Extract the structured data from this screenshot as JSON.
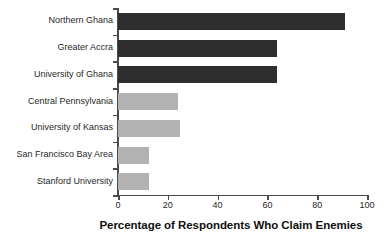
{
  "chart_data": {
    "type": "bar",
    "orientation": "horizontal",
    "title": "",
    "xlabel": "Percentage of Respondents Who Claim Enemies",
    "ylabel": "",
    "xlim": [
      0,
      100
    ],
    "xticks": [
      0,
      20,
      40,
      60,
      80,
      100
    ],
    "xtick_labels": [
      "0",
      "20",
      "40",
      "60",
      "80",
      "100"
    ],
    "grid": false,
    "legend": null,
    "categories": [
      "Northern Ghana",
      "Greater Accra",
      "University of Ghana",
      "Central Pennsylvania",
      "University of Kansas",
      "San Francisco Bay Area",
      "Stanford University"
    ],
    "values": [
      91,
      64,
      64,
      24,
      25,
      12.5,
      12.5
    ],
    "bar_colors": [
      "#2e2e2e",
      "#2e2e2e",
      "#2e2e2e",
      "#b2b2b2",
      "#b2b2b2",
      "#b2b2b2",
      "#b2b2b2"
    ],
    "bars": [
      {
        "label": "Northern Ghana",
        "value": 91,
        "color": "#2e2e2e",
        "shade": "dark"
      },
      {
        "label": "Greater Accra",
        "value": 64,
        "color": "#2e2e2e",
        "shade": "dark"
      },
      {
        "label": "University of Ghana",
        "value": 64,
        "color": "#2e2e2e",
        "shade": "dark"
      },
      {
        "label": "Central Pennsylvania",
        "value": 24,
        "color": "#b2b2b2",
        "shade": "light"
      },
      {
        "label": "University of Kansas",
        "value": 25,
        "color": "#b2b2b2",
        "shade": "light"
      },
      {
        "label": "San Francisco Bay Area",
        "value": 12.5,
        "color": "#b2b2b2",
        "shade": "light"
      },
      {
        "label": "Stanford University",
        "value": 12.5,
        "color": "#b2b2b2",
        "shade": "light"
      }
    ],
    "axis_color": "#4a4a4a",
    "background": "#ffffff"
  }
}
